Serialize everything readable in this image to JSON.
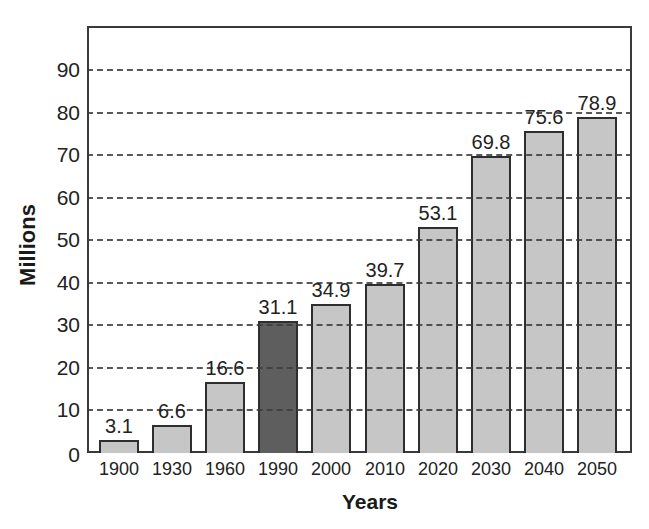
{
  "chart_data": {
    "type": "bar",
    "title": "",
    "xlabel": "Years",
    "ylabel": "Millions",
    "categories": [
      "1900",
      "1930",
      "1960",
      "1990",
      "2000",
      "2010",
      "2020",
      "2030",
      "2040",
      "2050"
    ],
    "values": [
      3.1,
      6.6,
      16.6,
      31.1,
      34.9,
      39.7,
      53.1,
      69.8,
      75.6,
      78.9
    ],
    "value_labels": [
      "3.1",
      "6.6",
      "16.6",
      "31.1",
      "34.9",
      "39.7",
      "53.1",
      "69.8",
      "75.6",
      "78.9"
    ],
    "highlighted_category": "1990",
    "ylim": [
      0,
      90
    ],
    "yticks": [
      0,
      10,
      20,
      30,
      40,
      50,
      60,
      70,
      80,
      90
    ],
    "grid": true,
    "grid_style": "dashed",
    "legend": null,
    "colors": {
      "bar": "#c6c6c6",
      "highlight_bar": "#5e5e5e",
      "bar_border": "#2e2e2e",
      "grid": "#3c3c3c"
    }
  }
}
